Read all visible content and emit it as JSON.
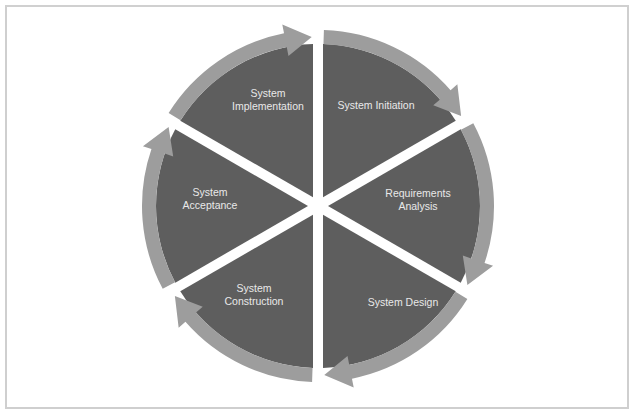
{
  "diagram": {
    "type": "cycle",
    "direction": "clockwise",
    "colors": {
      "background": "#ffffff",
      "frame_border": "#cfcfcf",
      "wedge_fill": "#5e5e5e",
      "ring_arrow": "#9d9d9d",
      "label_text": "#e9e9e9"
    },
    "phases": [
      {
        "id": "initiation",
        "lines": [
          "System Initiation"
        ]
      },
      {
        "id": "requirements",
        "lines": [
          "Requirements",
          "Analysis"
        ]
      },
      {
        "id": "design",
        "lines": [
          "System Design"
        ]
      },
      {
        "id": "construction",
        "lines": [
          "System",
          "Construction"
        ]
      },
      {
        "id": "acceptance",
        "lines": [
          "System",
          "Acceptance"
        ]
      },
      {
        "id": "implementation",
        "lines": [
          "System",
          "Implementation"
        ]
      }
    ]
  }
}
